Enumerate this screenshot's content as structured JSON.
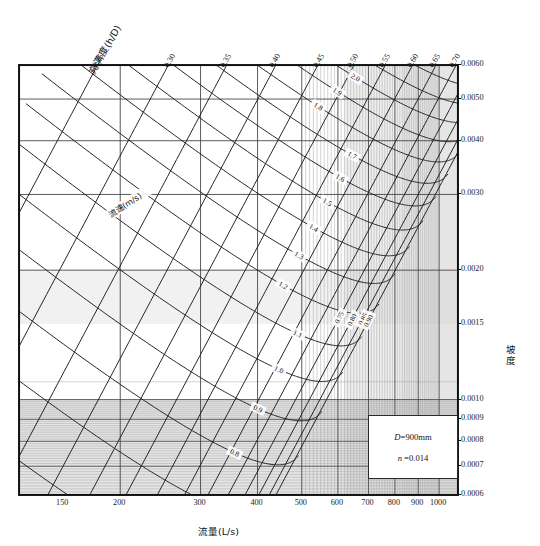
{
  "chart_data": {
    "type": "line",
    "title": "",
    "subtitle": "",
    "xlabel": "流量(L/s)",
    "ylabel_right": "坡度",
    "xlabel_top": "充满度(h/D)",
    "x_scale": "log",
    "y_scale": "log",
    "xlim": [
      120,
      1100
    ],
    "ylim": [
      0.0006,
      0.006
    ],
    "grid": true,
    "legend_position": "inside-bottom-right",
    "x_ticks": [
      "150",
      "200",
      "300",
      "400",
      "500",
      "600",
      "700",
      "800",
      "900",
      "1000"
    ],
    "x_tick_values": [
      150,
      200,
      300,
      400,
      500,
      600,
      700,
      800,
      900,
      1000
    ],
    "y_ticks_right": [
      "0.0060",
      "0.0050",
      "0.0040",
      "0.0030",
      "0.0020",
      "0.0015",
      "0.0010",
      "0.0009",
      "0.0008",
      "0.0007",
      "0.0006"
    ],
    "y_tick_values": [
      0.006,
      0.005,
      0.004,
      0.003,
      0.002,
      0.0015,
      0.001,
      0.0009,
      0.0008,
      0.0007,
      0.0006
    ],
    "top_ticks": [
      "0.25",
      "0.30",
      "0.35",
      "0.40",
      "0.45",
      "0.50",
      "0.55",
      "0.60",
      "0.65",
      "0.70"
    ],
    "top_tick_values": [
      0.25,
      0.3,
      0.35,
      0.4,
      0.45,
      0.5,
      0.55,
      0.6,
      0.65,
      0.7
    ],
    "series": [
      {
        "name": "充满度(h/D)",
        "kind": "fill-ratio-family",
        "labels": [
          "0.25",
          "0.30",
          "0.35",
          "0.40",
          "0.45",
          "0.50",
          "0.55",
          "0.60",
          "0.65",
          "0.70",
          "0.75",
          "0.80",
          "0.85",
          "0.90"
        ],
        "values": [
          0.25,
          0.3,
          0.35,
          0.4,
          0.45,
          0.5,
          0.55,
          0.6,
          0.65,
          0.7,
          0.75,
          0.8,
          0.85,
          0.9
        ]
      },
      {
        "name": "流速(m/s)",
        "kind": "velocity-family",
        "labels": [
          "0.6",
          "0.7",
          "0.8",
          "0.9",
          "1.0",
          "1.1",
          "1.2",
          "1.3",
          "1.4",
          "1.5",
          "1.6",
          "1.7",
          "1.8",
          "1.9",
          "2.0",
          "2.1",
          "2.2"
        ],
        "values": [
          0.6,
          0.7,
          0.8,
          0.9,
          1.0,
          1.1,
          1.2,
          1.3,
          1.4,
          1.5,
          1.6,
          1.7,
          1.8,
          1.9,
          2.0,
          2.1,
          2.2
        ]
      }
    ],
    "annotations": {
      "velocity_family_label": "流速(m/s)",
      "fill_family_label": "充满度(h/D)"
    }
  },
  "axes": {
    "bottom_title": "流量(L/s)",
    "right_title": "坡度",
    "top_title": "充满度(h/D)"
  },
  "legend": {
    "diameter": "D=900mm",
    "diameter_symbol": "D",
    "diameter_value": "=900mm",
    "roughness": "n =0.014",
    "roughness_symbol": "n",
    "roughness_value": " =0.014"
  },
  "colors": {
    "line": "#1a1a1a",
    "grid_minor": "#9a9a9a",
    "grid_major": "#4a4a4a",
    "background": "#ffffff",
    "shade": "#d9d9d9"
  }
}
